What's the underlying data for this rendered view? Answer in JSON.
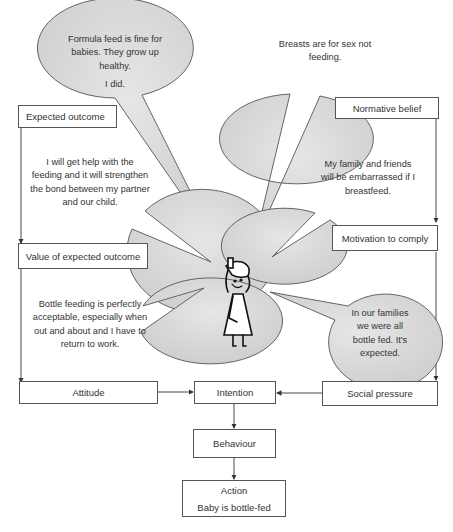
{
  "diagram": {
    "type": "theory-of-planned-behaviour-flow",
    "boxes": {
      "expected_outcome": "Expected outcome",
      "value_of_expected_outcome": "Value of expected outcome",
      "attitude": "Attitude",
      "normative_belief": "Normative belief",
      "motivation_to_comply": "Motivation to comply",
      "social_pressure": "Social pressure",
      "intention": "Intention",
      "behaviour": "Behaviour",
      "action_title": "Action",
      "action_detail": "Baby is bottle-fed"
    },
    "bubbles": {
      "formula": {
        "line1": "Formula feed is fine for babies. They grow up healthy.",
        "line2": "I did."
      },
      "breasts": "Breasts are for sex not feeding.",
      "help": "I will get help with the feeding and it will strengthen the bond between my partner and our child.",
      "family_embarrassed": "My family and friends will be embarrassed if I breastfeed.",
      "bottle_acceptable": "Bottle feeding is perfectly acceptable, especially when out and about and I have to return to work.",
      "families_bottle_fed": "In our families we were all bottle fed. It's expected."
    },
    "figure": "woman-holding-head",
    "colors": {
      "bubble_fill": "#d6d6d6",
      "bubble_stroke": "#555555",
      "box_stroke": "#555555",
      "arrow": "#333333"
    }
  }
}
